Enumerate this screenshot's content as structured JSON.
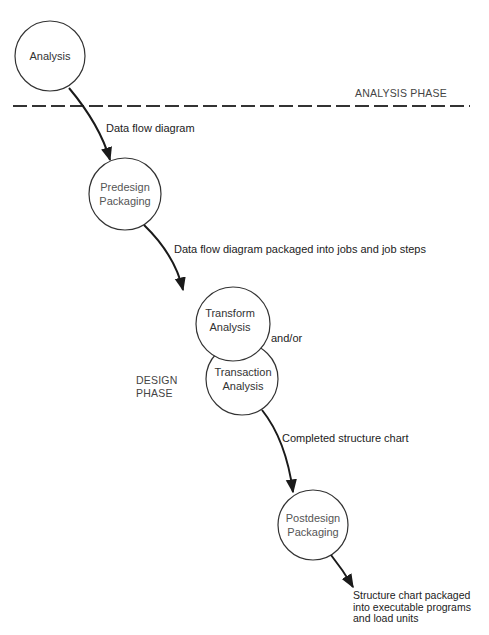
{
  "nodes": {
    "analysis": {
      "label": "Analysis"
    },
    "predesign": {
      "line1": "Predesign",
      "line2": "Packaging"
    },
    "transform": {
      "line1": "Transform",
      "line2": "Analysis"
    },
    "transaction": {
      "line1": "Transaction",
      "line2": "Analysis"
    },
    "postdesign": {
      "line1": "Postdesign",
      "line2": "Packaging"
    }
  },
  "phases": {
    "analysis_phase": "ANALYSIS PHASE",
    "design_phase_line1": "DESIGN",
    "design_phase_line2": "PHASE"
  },
  "edges": {
    "e1": "Data flow diagram",
    "e2": "Data flow diagram packaged into jobs and job steps",
    "and_or": "and/or",
    "e3": "Completed structure chart",
    "e4_line1": "Structure chart packaged",
    "e4_line2": "into executable programs",
    "e4_line3": "and load units"
  },
  "colors": {
    "stroke": "#1a1a1a",
    "text": "#222222",
    "background": "#ffffff"
  }
}
